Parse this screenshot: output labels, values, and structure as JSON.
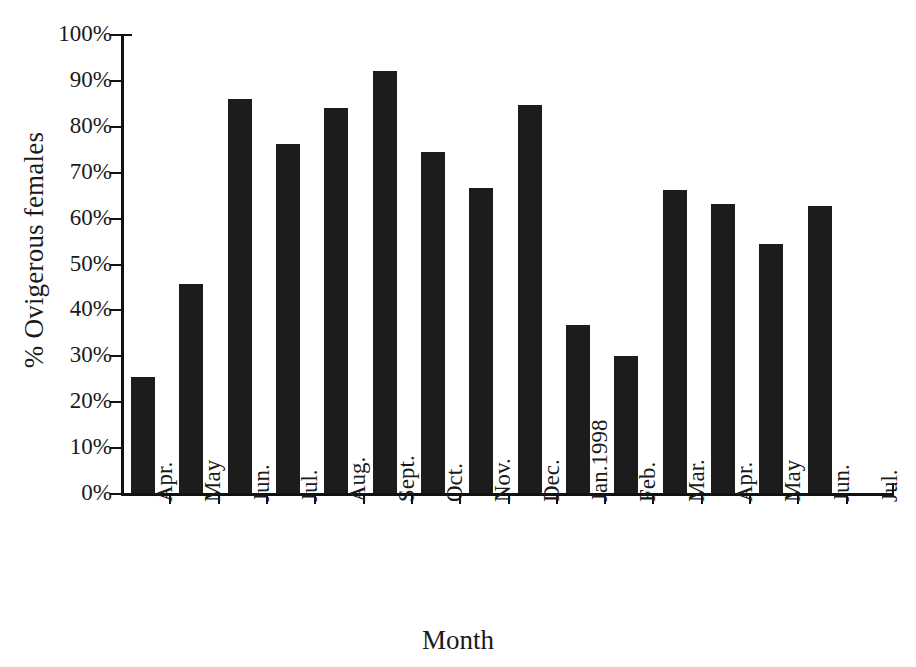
{
  "chart_data": {
    "type": "bar",
    "title": "",
    "xlabel": "Month",
    "ylabel": "% Ovigerous females",
    "categories": [
      "Apr.",
      "May",
      "Jun.",
      "Jul.",
      "Aug.",
      "Sept.",
      "Oct.",
      "Nov.",
      "Dec.",
      "Jan.1998",
      "Feb.",
      "Mar.",
      "Apr.",
      "May",
      "Jun.",
      "Jul."
    ],
    "values": [
      25.3,
      45.5,
      85.8,
      76.0,
      83.8,
      92.0,
      74.2,
      66.5,
      84.5,
      36.7,
      29.8,
      66.0,
      63.0,
      54.3,
      62.5,
      null
    ],
    "ylim": [
      0,
      100
    ],
    "yticks": [
      0,
      10,
      20,
      30,
      40,
      50,
      60,
      70,
      80,
      90,
      100
    ],
    "ytick_labels": [
      "0%",
      "10%",
      "20%",
      "30%",
      "40%",
      "50%",
      "60%",
      "70%",
      "80%",
      "90%",
      "100%"
    ],
    "grid": false,
    "legend": null,
    "bar_color": "#1c1c1c",
    "axis_color": "#111111",
    "background": "#ffffff"
  }
}
